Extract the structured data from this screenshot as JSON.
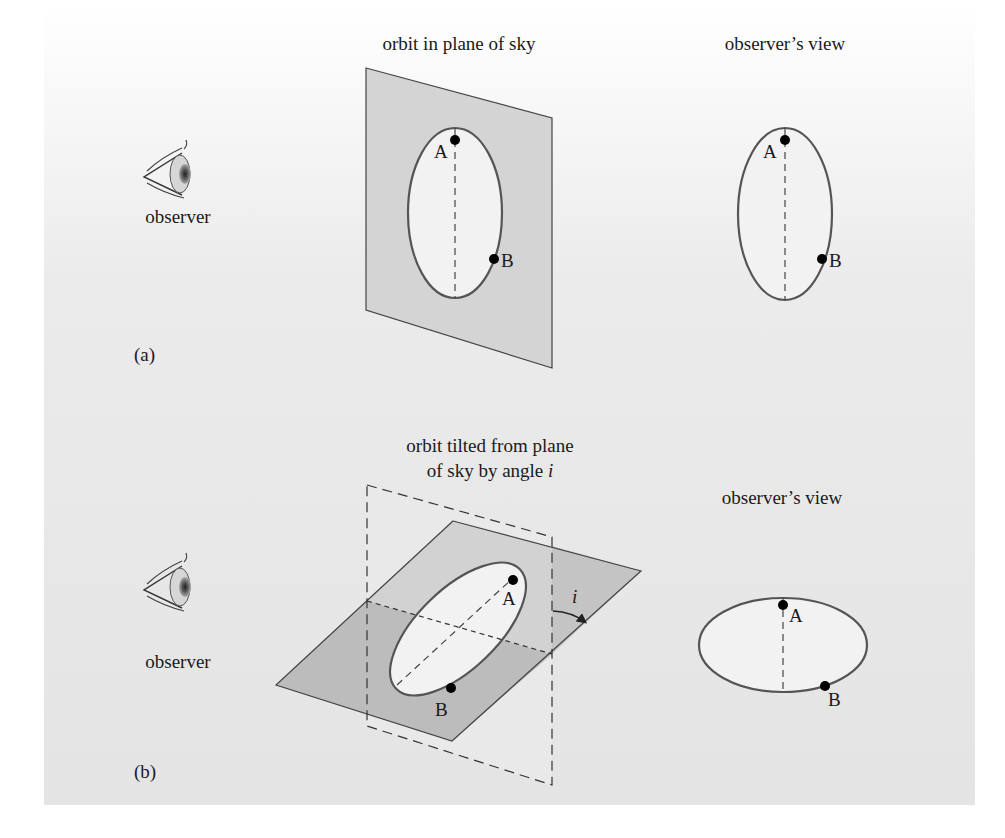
{
  "panel_a": {
    "label": "(a)",
    "observer_label": "observer",
    "left_title": "orbit in plane of sky",
    "right_title": "observer’s view",
    "point_a": "A",
    "point_b": "B"
  },
  "panel_b": {
    "label": "(b)",
    "observer_label": "observer",
    "left_title_line1": "orbit tilted from plane",
    "left_title_line2": "of sky by angle ",
    "angle_symbol": "i",
    "right_title": "observer’s view",
    "point_a": "A",
    "point_b": "B"
  },
  "colors": {
    "plane_fill": "#d4d4d4",
    "plane_dark_fill": "#b9b9b9",
    "orbit_stroke": "#555555",
    "orbit_fill": "#f2f2f2",
    "panel_top": "#ffffff",
    "panel_bottom": "#e4e4e4"
  }
}
